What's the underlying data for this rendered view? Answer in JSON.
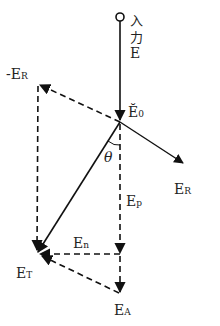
{
  "diagram": {
    "input_label_line1": "入",
    "input_label_line2": "力",
    "input_label_line3": "E",
    "origin_label": "Ĕ",
    "origin_sub": "0",
    "neg_er_prefix": "-E",
    "neg_er_sub": "R",
    "er_label": "E",
    "er_sub": "R",
    "theta": "θ",
    "ep_label": "E",
    "ep_sub": "p",
    "en_label": "E",
    "en_sub": "n",
    "et_label": "E",
    "et_sub": "T",
    "ea_label": "E",
    "ea_sub": "A",
    "line_color": "#111111"
  }
}
